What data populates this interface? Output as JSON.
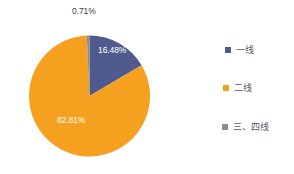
{
  "chart_data": {
    "type": "pie",
    "title": "",
    "categories": [
      "一线",
      "二线",
      "三、四线"
    ],
    "values": [
      16.48,
      82.81,
      0.71
    ],
    "value_labels": [
      "16.48%",
      "82.81%",
      "0.71%"
    ],
    "colors": [
      "#4f5b8e",
      "#f5a11f",
      "#8c8c8c"
    ],
    "legend_position": "right",
    "grid": false,
    "xlabel": "",
    "ylabel": "",
    "units": "%"
  },
  "slices": [
    {
      "name": "一线",
      "percent_label": "16.48%",
      "color": "#4f5b8e",
      "label_placement": "inside"
    },
    {
      "name": "二线",
      "percent_label": "82.81%",
      "color": "#f5a11f",
      "label_placement": "inside"
    },
    {
      "name": "三、四线",
      "percent_label": "0.71%",
      "color": "#8c8c8c",
      "label_placement": "outside"
    }
  ],
  "legend": {
    "items": [
      {
        "label": "一线",
        "color": "#4f5b8e"
      },
      {
        "label": "二线",
        "color": "#f5a11f"
      },
      {
        "label": "三、四线",
        "color": "#8c8c8c"
      }
    ]
  }
}
